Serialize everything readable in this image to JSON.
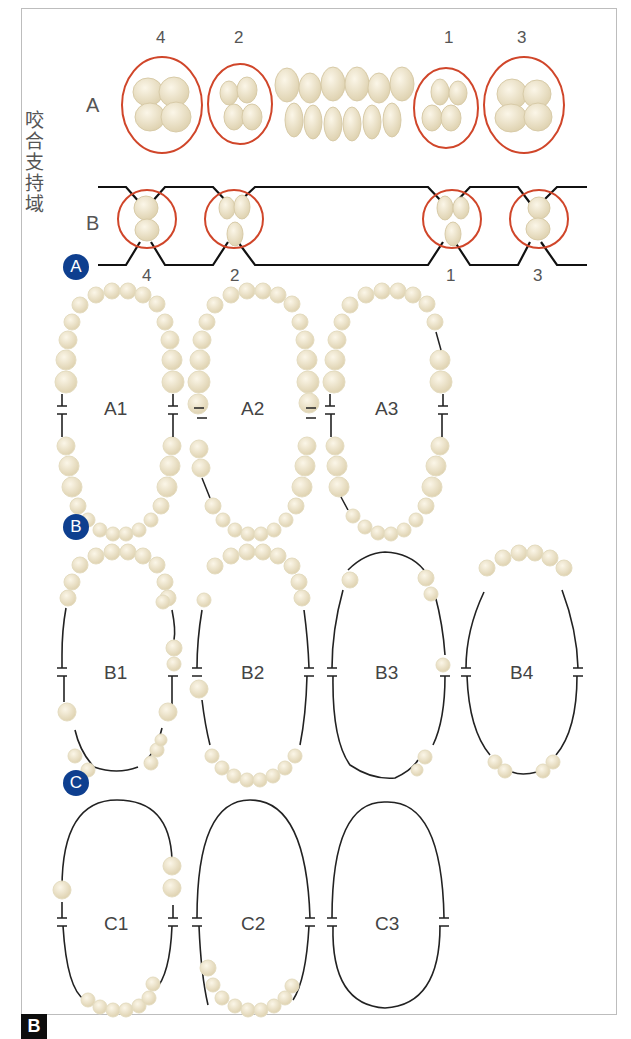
{
  "figure": {
    "corner_label": "B",
    "vertical_label": "咬合支持域",
    "top_panel": {
      "row_a_label": "A",
      "row_b_label": "B",
      "top_numbers": [
        "4",
        "2",
        "1",
        "3"
      ],
      "bottom_numbers": [
        "4",
        "2",
        "1",
        "3"
      ]
    },
    "groups": [
      {
        "badge": "A",
        "arches": [
          "A1",
          "A2",
          "A3"
        ]
      },
      {
        "badge": "B",
        "arches": [
          "B1",
          "B2",
          "B3",
          "B4"
        ]
      },
      {
        "badge": "C",
        "arches": [
          "C1",
          "C2",
          "C3"
        ]
      }
    ],
    "colors": {
      "badge": "#0e3f8f",
      "circle": "#d0462a",
      "tooth": "#efe7cf",
      "line": "#222222"
    }
  }
}
